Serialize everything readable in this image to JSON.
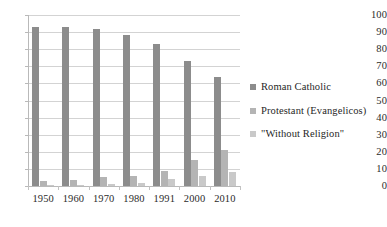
{
  "chart_data": {
    "type": "bar",
    "title": "",
    "xlabel": "",
    "ylabel": "",
    "categories": [
      "1950",
      "1960",
      "1970",
      "1980",
      "1991",
      "2000",
      "2010"
    ],
    "series": [
      {
        "name": "Roman Catholic",
        "color": "#8c8c8c",
        "values": [
          93.0,
          93.0,
          91.7,
          88.5,
          82.8,
          73.0,
          64.0
        ]
      },
      {
        "name": "Protestant (Evangelicos)",
        "color": "#b4b4b4",
        "values": [
          3.0,
          3.5,
          5.0,
          6.0,
          8.5,
          15.0,
          21.0
        ]
      },
      {
        "name": "\"Without Religion\"",
        "color": "#c9c9c9",
        "values": [
          0.5,
          0.6,
          1.0,
          1.5,
          4.0,
          6.0,
          8.0
        ]
      }
    ],
    "ylim": [
      0,
      100
    ],
    "ytick_step": 10,
    "yticks": [
      "100",
      "90",
      "80",
      "70",
      "60",
      "50",
      "40",
      "30",
      "20",
      "10",
      "0"
    ],
    "grid": true,
    "legend_position": "right"
  }
}
